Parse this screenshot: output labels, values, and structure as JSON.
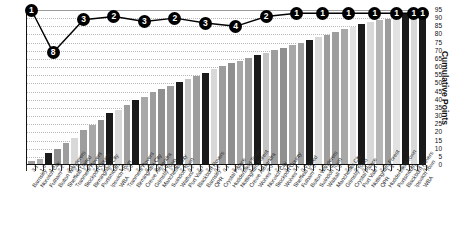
{
  "chart_data": {
    "type": "bar",
    "title": "",
    "subtitle": "",
    "xlabel": "",
    "ylabel": "Cumulative Points",
    "ylim": [
      0,
      95
    ],
    "ytick_step": 5,
    "yticks": [
      0,
      5,
      10,
      15,
      20,
      25,
      30,
      35,
      40,
      45,
      50,
      55,
      60,
      65,
      70,
      75,
      80,
      85,
      90,
      95
    ],
    "grid": true,
    "legend": "none",
    "categories": [
      "Barnsley",
      "Norwich City",
      "Fulham",
      "Bolton Wanderers",
      "Sheffield United",
      "Tranmere Rovers",
      "Stockport County",
      "Birmingham City",
      "Portsmouth",
      "Ipswich Town",
      "WBA",
      "Tranmere Rovers",
      "Birmingham City",
      "Crewe Alexandra",
      "Grimsby Town",
      "Manchester City",
      "Swindon Town",
      "Watford",
      "Port Vale",
      "Blackburn Rovers",
      "Barnsley",
      "QPR",
      "Crystal Palace",
      "Huddersfield Town",
      "Nottingham Forest",
      "Crewe Alexandra",
      "Wolves",
      "Norwich City",
      "Stockport County",
      "Wolves",
      "Sheffield United",
      "Fulham",
      "Bolton Wanderers",
      "Swindon Town",
      "Walsall",
      "Manchester City",
      "Grimsby Town",
      "Crystal Palace",
      "Port Vale",
      "Nottingham Forest",
      "QPR",
      "Huddersfield Town",
      "Portsmouth",
      "Blackburn Rovers",
      "Ipswich Town",
      "WBA"
    ],
    "point_values": [
      "3.1",
      "1.0",
      "1.2",
      "2.2",
      "2.1",
      "2.0",
      "2.0",
      "2.1",
      "2.2",
      "2.0",
      "1.0",
      "2.0",
      "2.4",
      "0.0",
      "3.2",
      "0.0",
      "2.0",
      "2.1",
      "0.2",
      "2.1",
      "2.1",
      "0.2",
      "0.1",
      "2.1",
      "2.2",
      "1.2",
      "1.1",
      "0.0",
      "2.1",
      "3.0",
      "3.1",
      "0.0",
      "3.0",
      "1.0",
      "1.0",
      "1.0",
      "2.0",
      "0.2",
      "0.1",
      "1.1",
      "2.0",
      "1.3",
      "1.2",
      "1.1",
      "1.3",
      "0.2"
    ],
    "values": [
      2,
      3,
      7,
      9,
      13,
      16,
      21,
      24,
      27,
      31,
      33,
      36,
      39,
      41,
      44,
      46,
      48,
      50,
      52,
      54,
      56,
      58,
      60,
      62,
      63,
      65,
      67,
      68,
      70,
      71,
      73,
      74,
      76,
      78,
      79,
      81,
      83,
      84,
      86,
      87,
      88,
      89,
      91,
      92,
      93,
      93
    ],
    "bar_shades": [
      "#9d9d9d",
      "#b0b0b0",
      "#1a1a1a",
      "#8f8f8f",
      "#9d9d9d",
      "#d8d8d8",
      "#9d9d9d",
      "#a8a8a8",
      "#8f8f8f",
      "#1a1a1a",
      "#d8d8d8",
      "#9d9d9d",
      "#1a1a1a",
      "#a8a8a8",
      "#9d9d9d",
      "#8f8f8f",
      "#9d9d9d",
      "#1a1a1a",
      "#c4c4c4",
      "#9d9d9d",
      "#1a1a1a",
      "#d8d8d8",
      "#9d9d9d",
      "#8f8f8f",
      "#a8a8a8",
      "#9d9d9d",
      "#1a1a1a",
      "#c4c4c4",
      "#9d9d9d",
      "#8f8f8f",
      "#a8a8a8",
      "#9d9d9d",
      "#1a1a1a",
      "#d8d8d8",
      "#9d9d9d",
      "#9d9d9d",
      "#a8a8a8",
      "#e2e2e2",
      "#1a1a1a",
      "#d8d8d8",
      "#b6b6b6",
      "#9d9d9d",
      "#e2e2e2",
      "#1a1a1a",
      "#d8d8d8",
      "#1a1a1a"
    ],
    "line_series": {
      "name": "Points gained",
      "labels": [
        "1",
        "8",
        "3",
        "2",
        "3",
        "2",
        "3",
        "4",
        "2",
        "1",
        "1",
        "1",
        "1",
        "1",
        "1",
        "1"
      ],
      "positions_x": [
        0.5,
        3.0,
        6.5,
        10.0,
        13.5,
        17.0,
        20.5,
        24.0,
        27.5,
        31.0,
        34.0,
        37.0,
        40.0,
        42.5,
        44.5,
        45.5
      ],
      "positions_y": [
        95,
        69,
        89,
        91,
        88,
        90,
        87,
        85,
        91,
        93,
        93,
        93,
        93,
        93,
        93,
        93
      ]
    }
  }
}
